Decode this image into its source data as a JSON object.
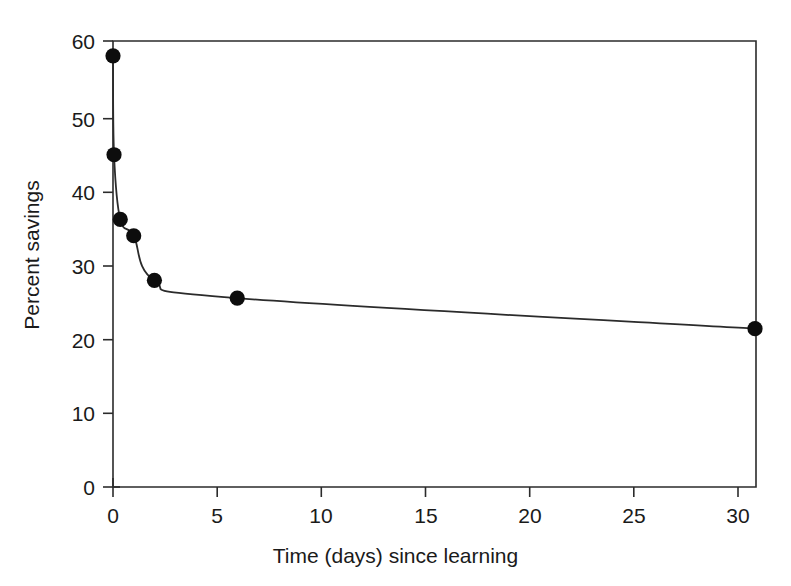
{
  "chart_data": {
    "type": "line",
    "title": "",
    "subtitle": "",
    "xlabel": "Time (days) since learning",
    "ylabel": "Percent savings",
    "xlim": [
      0,
      31
    ],
    "ylim": [
      0,
      60
    ],
    "xticks": [
      0,
      5,
      10,
      15,
      20,
      25,
      30
    ],
    "xtick_labels": [
      "0",
      "5",
      "10",
      "15",
      "20",
      "25",
      "30"
    ],
    "yticks": [
      0,
      10,
      20,
      30,
      40,
      50,
      60
    ],
    "ytick_labels": [
      "0",
      "10",
      "20",
      "30",
      "40",
      "50",
      "60"
    ],
    "grid": false,
    "legend": null,
    "legend_position": "none",
    "annotations": [],
    "series": [
      {
        "name": "Percent savings",
        "marker": "filled-circle",
        "marker_color": "#0d0d0d",
        "line_color": "#2b2b2b",
        "x": [
          0.0,
          0.05,
          0.35,
          1.0,
          2.0,
          6.0,
          31.0
        ],
        "y": [
          58.0,
          44.7,
          36.0,
          33.8,
          27.8,
          25.4,
          21.3
        ]
      }
    ],
    "points": [
      {
        "x": 0.0,
        "y": 58.0
      },
      {
        "x": 0.05,
        "y": 44.7
      },
      {
        "x": 0.35,
        "y": 36.0
      },
      {
        "x": 1.0,
        "y": 33.8
      },
      {
        "x": 2.0,
        "y": 27.8
      },
      {
        "x": 6.0,
        "y": 25.4
      },
      {
        "x": 31.0,
        "y": 21.3
      }
    ]
  },
  "axes": {
    "x_title": "Time (days) since learning",
    "y_title": "Percent savings",
    "x_tick_labels": [
      "0",
      "5",
      "10",
      "15",
      "20",
      "25",
      "30"
    ],
    "y_tick_labels": [
      "0",
      "10",
      "20",
      "30",
      "40",
      "50",
      "60"
    ]
  },
  "style": {
    "background": "#ffffff",
    "axis_color": "#2b2b2b",
    "line_color": "#2b2b2b",
    "marker_color": "#0d0d0d",
    "text_color": "#1a1a1a"
  }
}
